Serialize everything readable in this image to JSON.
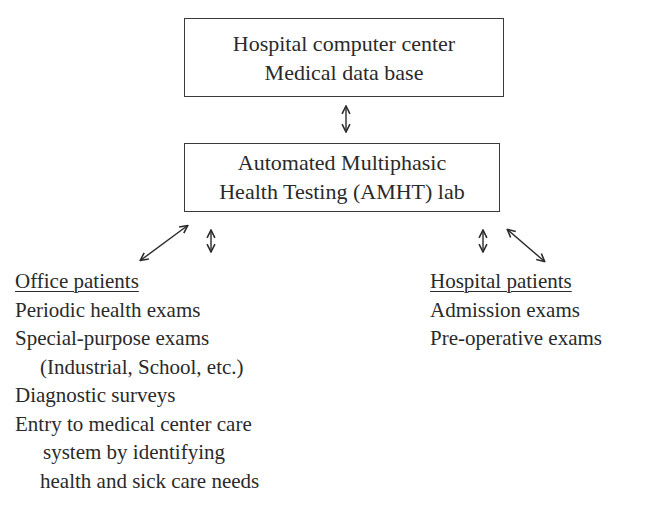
{
  "top_box": {
    "line1": "Hospital computer center",
    "line2": "Medical data base"
  },
  "middle_box": {
    "line1": "Automated Multiphasic",
    "line2": "Health Testing (AMHT) lab"
  },
  "office_patients": {
    "header": "Office patients",
    "items": [
      "Periodic health exams",
      "Special-purpose exams",
      "(Industrial, School, etc.)",
      "Diagnostic surveys",
      "Entry to medical center care",
      "system by identifying",
      "health and sick care needs"
    ]
  },
  "hospital_patients": {
    "header": "Hospital patients",
    "items": [
      "Admission exams",
      "Pre-operative exams"
    ]
  },
  "arrows": [
    {
      "from": "top_box",
      "to": "middle_box",
      "type": "bidirectional-vertical"
    },
    {
      "from": "middle_box",
      "to": "office_patients",
      "type": "bidirectional-diagonal"
    },
    {
      "from": "middle_box",
      "to": "office_patients",
      "type": "bidirectional-vertical"
    },
    {
      "from": "middle_box",
      "to": "hospital_patients",
      "type": "bidirectional-vertical"
    },
    {
      "from": "middle_box",
      "to": "hospital_patients",
      "type": "bidirectional-diagonal"
    }
  ]
}
